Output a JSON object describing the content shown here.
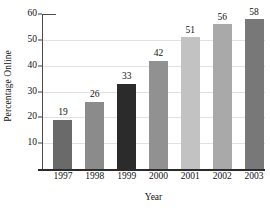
{
  "chart_data": {
    "type": "bar",
    "title": "",
    "subtitle": "",
    "xlabel": "Year",
    "ylabel": "Percentage Online",
    "categories": [
      "1997",
      "1998",
      "1999",
      "2000",
      "2001",
      "2002",
      "2003"
    ],
    "values": [
      19,
      26,
      33,
      42,
      51,
      56,
      58
    ],
    "data_labels": [
      "19",
      "26",
      "33",
      "42",
      "51",
      "56",
      "58"
    ],
    "bar_colors": [
      "#6a6a6a",
      "#8b8b8b",
      "#2b2b2b",
      "#919191",
      "#c2c2c2",
      "#a9a9a9",
      "#787878"
    ],
    "ylim": [
      0,
      60
    ],
    "yticks": [
      10,
      20,
      30,
      40,
      50,
      60
    ],
    "ytick_labels": [
      "10",
      "20",
      "30",
      "40",
      "50",
      "60"
    ],
    "xtick_labels": [
      "1997",
      "1998",
      "1999",
      "2000",
      "2001",
      "2002",
      "2003"
    ],
    "grid": true,
    "grid_axis": "y",
    "legend": false,
    "legend_position": "none",
    "series": [
      {
        "name": "Percentage Online",
        "values": [
          19,
          26,
          33,
          42,
          51,
          56,
          58
        ]
      }
    ]
  },
  "axes": {
    "y_title": "Percentage Online",
    "x_title": "Year"
  }
}
